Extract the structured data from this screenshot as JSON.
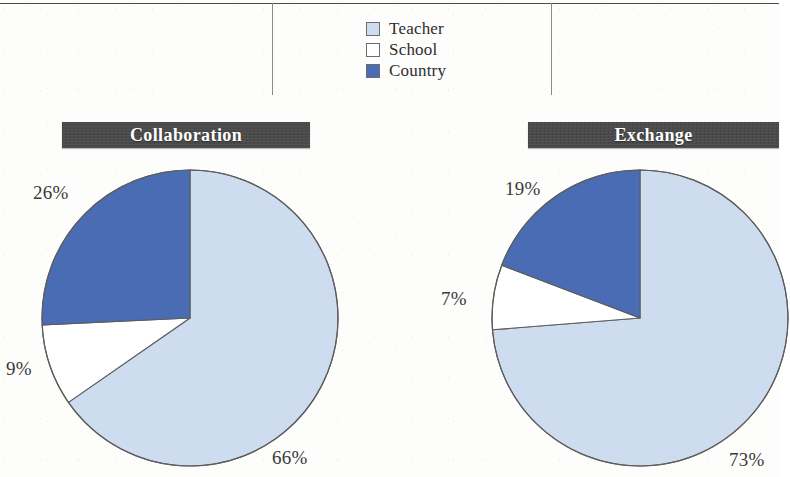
{
  "figure": {
    "title": "",
    "legend": {
      "name": "chart-legend",
      "items": [
        {
          "label": "Teacher",
          "color": "#cddcee"
        },
        {
          "label": "School",
          "color": "#ffffff"
        },
        {
          "label": "Country",
          "color": "#4a6cb5"
        }
      ]
    },
    "panels": [
      {
        "id": "collaboration",
        "banner_label": "Collaboration"
      },
      {
        "id": "exchange",
        "banner_label": "Exchange"
      }
    ],
    "labels": {
      "collab_country": "26%",
      "collab_school": "9%",
      "collab_teacher": "66%",
      "exch_country": "19%",
      "exch_school": "7%",
      "exch_teacher": "73%"
    }
  },
  "chart_data": [
    {
      "type": "pie",
      "title": "Collaboration",
      "categories": [
        "Teacher",
        "School",
        "Country"
      ],
      "values": [
        66,
        9,
        26
      ],
      "value_labels": [
        "66%",
        "9%",
        "26%"
      ],
      "colors": [
        "#cddcee",
        "#ffffff",
        "#4a6cb5"
      ],
      "units": "percent",
      "start_angle_deg": 0,
      "direction": "clockwise",
      "legend_position": "top-center",
      "grid": false,
      "xlabel": "",
      "ylabel": ""
    },
    {
      "type": "pie",
      "title": "Exchange",
      "categories": [
        "Teacher",
        "School",
        "Country"
      ],
      "values": [
        73,
        7,
        19
      ],
      "value_labels": [
        "73%",
        "7%",
        "19%"
      ],
      "colors": [
        "#cddcee",
        "#ffffff",
        "#4a6cb5"
      ],
      "units": "percent",
      "start_angle_deg": 0,
      "direction": "clockwise",
      "legend_position": "top-center",
      "grid": false,
      "xlabel": "",
      "ylabel": ""
    }
  ]
}
